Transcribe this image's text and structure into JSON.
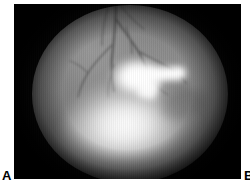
{
  "figure": {
    "type": "retinal-fundus-photograph",
    "panel_labels": {
      "left": "A",
      "right": "B"
    },
    "panel_a": {
      "modality": "fundus photography",
      "frame_background": "#050505",
      "field_shape": "circular",
      "field_base_color": "#7f7f7f",
      "highlight_color": "#ffffff",
      "vessel_color": "#3c3c3c",
      "findings": [
        "branching retinal vessel tree descending from superior field",
        "large confluent hyperreflective white lesion inferocentral",
        "bright spur-shaped extension temporal to the lesion",
        "diffuse inferior haze obscuring detail"
      ]
    }
  },
  "canvas": {
    "background": "#ffffff",
    "width": "250",
    "height": "192"
  }
}
